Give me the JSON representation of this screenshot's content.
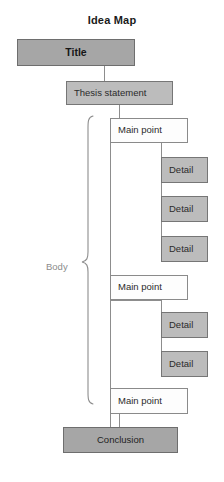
{
  "diagram": {
    "heading": "Idea Map",
    "type": "flowchart",
    "body_label": "Body",
    "nodes": {
      "title": {
        "label": "Title",
        "fill": "#a6a6a6",
        "stroke": "#6e6e6e"
      },
      "thesis": {
        "label": "Thesis statement",
        "fill": "#bcbcbc",
        "stroke": "#767676"
      },
      "conclusion": {
        "label": "Conclusion",
        "fill": "#a6a6a6",
        "stroke": "#6e6e6e"
      }
    },
    "main_points": [
      {
        "label": "Main point"
      },
      {
        "label": "Main point"
      },
      {
        "label": "Main point"
      }
    ],
    "details": [
      {
        "label": "Detail",
        "parent": 0
      },
      {
        "label": "Detail",
        "parent": 0
      },
      {
        "label": "Detail",
        "parent": 0
      },
      {
        "label": "Detail",
        "parent": 1
      },
      {
        "label": "Detail",
        "parent": 1
      }
    ],
    "colors": {
      "dark_fill": "#a6a6a6",
      "mid_fill": "#bcbcbc",
      "light_fill": "#fdfdfd",
      "line": "#8d8d8d",
      "text": "#2b2b2b",
      "muted_text": "#8c8c8c"
    }
  }
}
